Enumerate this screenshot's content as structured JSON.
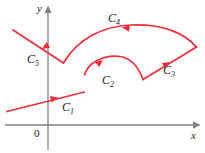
{
  "figure": {
    "background_color": "#ffffff",
    "width": 205,
    "height": 153
  },
  "axes": {
    "color": "#808285",
    "x_axis": {
      "label": "x",
      "name": "x-axis",
      "orientation": "horizontal",
      "y_pixel": 125,
      "x_start": 5,
      "x_end": 197,
      "arrow": "right"
    },
    "y_axis": {
      "label": "y",
      "name": "y-axis",
      "orientation": "vertical",
      "x_pixel": 48,
      "y_start": 148,
      "y_end": 8,
      "arrow": "up"
    },
    "origin": {
      "label": "0",
      "x_pixel": 48,
      "y_pixel": 125
    }
  },
  "curve": {
    "color": "#ed2e38",
    "stroke_width": 1.6,
    "segments": [
      {
        "label": "C",
        "subscript": "1",
        "name": "curve-c1",
        "kind": "line",
        "description": "straight line rising gently to the right from lower-left",
        "start": [
          7,
          111
        ],
        "end": [
          84,
          92
        ],
        "arrow_direction": "right",
        "arrow_at": [
          56,
          98
        ]
      },
      {
        "label": "C",
        "subscript": "2",
        "name": "curve-c2",
        "kind": "arc",
        "description": "arc rising from the end of C1, cresting, then dipping down to the right",
        "start": [
          84,
          75
        ],
        "peak": [
          124,
          57
        ],
        "end": [
          143,
          79
        ],
        "arrow_direction": "up-right",
        "arrow_at": [
          101,
          62
        ]
      },
      {
        "label": "C",
        "subscript": "3",
        "name": "curve-c3",
        "kind": "line",
        "description": "straight line climbing to the rightmost vertex",
        "start": [
          143,
          79
        ],
        "end": [
          196,
          47
        ],
        "arrow_direction": "up-right",
        "arrow_at": [
          166,
          63
        ]
      },
      {
        "label": "C",
        "subscript": "4",
        "name": "curve-c4",
        "kind": "arc",
        "description": "long arc sweeping back leftward across the top",
        "start": [
          196,
          47
        ],
        "peak": [
          128,
          28
        ],
        "end": [
          63,
          63
        ],
        "arrow_direction": "left",
        "arrow_at": [
          124,
          29
        ]
      },
      {
        "label": "C",
        "subscript": "5",
        "name": "curve-c5",
        "kind": "line",
        "description": "straight line descending to the left, crossing the y-axis",
        "start": [
          63,
          63
        ],
        "end": [
          13,
          30
        ],
        "arrow_direction": "down-right",
        "arrow_at": [
          38,
          47
        ]
      }
    ]
  }
}
